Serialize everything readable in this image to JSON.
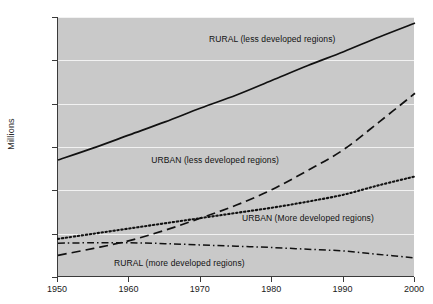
{
  "chart_data": {
    "type": "line",
    "title": "",
    "xlabel": "",
    "ylabel": "Millions",
    "xlim": [
      1950,
      2000
    ],
    "ylim": [
      0,
      3000
    ],
    "grid": true,
    "legend_position": "inline-annotations",
    "x": [
      1950,
      1955,
      1960,
      1965,
      1970,
      1975,
      1980,
      1985,
      1990,
      1995,
      2000
    ],
    "xticks": [
      "1950",
      "1960",
      "1970",
      "1980",
      "1990",
      "2000"
    ],
    "yticks": [
      "0",
      "500",
      "1,000",
      "1,500",
      "2,000",
      "2,500",
      "3,000"
    ],
    "series": [
      {
        "name": "RURAL (less developed regions)",
        "style": "solid",
        "values": [
          1350,
          1490,
          1640,
          1790,
          1950,
          2100,
          2270,
          2440,
          2600,
          2770,
          2930
        ]
      },
      {
        "name": "URBAN (less developed regions)",
        "style": "dashed",
        "values": [
          250,
          330,
          420,
          540,
          680,
          830,
          1010,
          1230,
          1470,
          1790,
          2120
        ]
      },
      {
        "name": "URBAN (More developed regions)",
        "style": "dotted",
        "values": [
          440,
          500,
          560,
          620,
          680,
          740,
          800,
          870,
          950,
          1060,
          1160
        ]
      },
      {
        "name": "RURAL (more developed regions)",
        "style": "dash-dot",
        "values": [
          390,
          395,
          395,
          385,
          370,
          355,
          340,
          320,
          300,
          260,
          220
        ]
      }
    ],
    "annotations": [
      {
        "text": "RURAL (less developed regions)",
        "x": 1980,
        "y": 2740
      },
      {
        "text": "URBAN (less developed regions)",
        "x": 1972,
        "y": 1340
      },
      {
        "text": "URBAN (More developed regions)",
        "x": 1985,
        "y": 670
      },
      {
        "text": "RURAL (more developed regions)",
        "x": 1967,
        "y": 150
      }
    ],
    "colors": {
      "plot_background": "#c9c9c9",
      "gridline": "#f2f2f2",
      "line": "#111111",
      "axis": "#3a3a3a",
      "text": "#1a1a1a"
    }
  }
}
